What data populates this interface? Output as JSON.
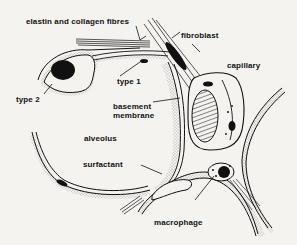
{
  "diagram": {
    "labels": {
      "elastin": "elastin and collagen fibres",
      "fibroblast": "fibroblast",
      "type1": "type 1",
      "type2": "type 2",
      "capillary": "capillary",
      "basement_line1": "basement",
      "basement_line2": "membrane",
      "alveolus": "alveolus",
      "surfactant": "surfactant",
      "macrophage": "macrophage"
    },
    "colors": {
      "background": "#f4f3f0",
      "ink": "#111111",
      "stipple": "#555555"
    }
  }
}
